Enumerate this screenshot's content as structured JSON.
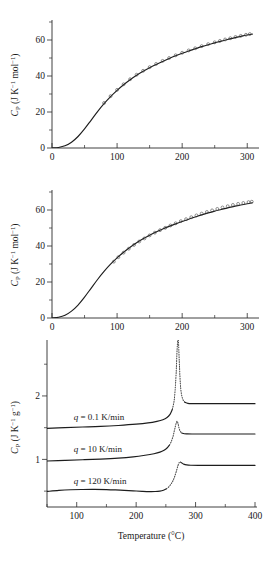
{
  "figure": {
    "background": "#ffffff",
    "curve_color": "#1d1d1d",
    "marker_color": "#3a3a3a",
    "axis_color": "#2b2b2b"
  },
  "panels": [
    {
      "id": "panel-top",
      "ylabel_parts": {
        "sym": "C",
        "sub": "P",
        "unit_open": " (J K",
        "unit_sup1": "−1",
        "unit_mid": " mol",
        "unit_sup2": "−1",
        "unit_close": ")"
      },
      "xlabel": "",
      "xticks": [
        0,
        100,
        200,
        300
      ],
      "xtick_labels": [
        "0",
        "100",
        "200",
        "300"
      ],
      "xminor": [
        50,
        150,
        250
      ],
      "yticks": [
        0,
        20,
        40,
        60
      ],
      "ytick_labels": [
        "0",
        "20",
        "40",
        "60"
      ],
      "yminor": [
        10,
        30,
        50,
        70
      ],
      "xlim": [
        0,
        315
      ],
      "ylim": [
        0,
        70
      ],
      "has_markers": true
    },
    {
      "id": "panel-mid",
      "ylabel_parts": {
        "sym": "C",
        "sub": "P",
        "unit_open": " (J K",
        "unit_sup1": "−1",
        "unit_mid": " mol",
        "unit_sup2": "−1",
        "unit_close": ")"
      },
      "xlabel": "",
      "xticks": [
        0,
        100,
        200,
        300
      ],
      "xtick_labels": [
        "0",
        "100",
        "200",
        "300"
      ],
      "xminor": [
        50,
        150,
        250
      ],
      "yticks": [
        0,
        20,
        40,
        60
      ],
      "ytick_labels": [
        "0",
        "20",
        "40",
        "60"
      ],
      "yminor": [
        10,
        30,
        50,
        70
      ],
      "xlim": [
        0,
        315
      ],
      "ylim": [
        0,
        70
      ],
      "has_markers": true
    },
    {
      "id": "panel-bot",
      "ylabel_parts": {
        "sym": "C",
        "sub": "P",
        "unit_open": " (J K",
        "unit_sup1": "−1",
        "unit_mid": " g",
        "unit_sup2": "−1",
        "unit_close": ")"
      },
      "xlabel": "Temperature (°C)",
      "xticks": [
        100,
        200,
        300,
        400
      ],
      "xtick_labels": [
        "100",
        "200",
        "300",
        "400"
      ],
      "xminor": [
        50,
        150,
        250,
        350
      ],
      "yticks": [
        1,
        2
      ],
      "ytick_labels": [
        "1",
        "2"
      ],
      "yminor": [
        0.5,
        1.5,
        2.5
      ],
      "xlim": [
        50,
        400
      ],
      "ylim": [
        0.25,
        2.85
      ],
      "has_markers": false
    }
  ],
  "chart_data": [
    {
      "type": "line",
      "panel": "panel-top",
      "title": "",
      "xlabel": "Temperature (K)",
      "ylabel": "C_P (J K^-1 mol^-1)",
      "xlim": [
        0,
        315
      ],
      "ylim": [
        0,
        70
      ],
      "grid": false,
      "legend": "none",
      "series": [
        {
          "name": "fitted heat capacity curve",
          "style": "solid-line",
          "x": [
            0,
            10,
            20,
            30,
            40,
            50,
            60,
            70,
            80,
            90,
            100,
            110,
            120,
            130,
            140,
            150,
            160,
            170,
            180,
            190,
            200,
            210,
            220,
            230,
            240,
            250,
            260,
            270,
            280,
            290,
            300,
            308
          ],
          "y": [
            0,
            0.3,
            1.2,
            3.2,
            6.4,
            10.6,
            15.4,
            20.2,
            24.6,
            28.5,
            32.0,
            35.1,
            37.9,
            40.4,
            42.6,
            44.6,
            46.4,
            48.1,
            49.7,
            51.2,
            52.6,
            53.9,
            55.1,
            56.3,
            57.4,
            58.4,
            59.4,
            60.3,
            61.2,
            62.0,
            62.8,
            63.3
          ]
        },
        {
          "name": "experimental data points",
          "style": "open-circles",
          "x": [
            80,
            90,
            100,
            110,
            120,
            130,
            140,
            150,
            160,
            170,
            180,
            190,
            200,
            210,
            220,
            230,
            240,
            250,
            258,
            266,
            274,
            282,
            290,
            298,
            304
          ],
          "y": [
            25.0,
            28.8,
            32.3,
            35.4,
            38.2,
            40.7,
            42.9,
            44.9,
            46.7,
            48.4,
            50.0,
            51.5,
            52.9,
            54.2,
            55.4,
            56.6,
            57.7,
            58.7,
            59.5,
            60.3,
            61.0,
            61.7,
            62.3,
            62.9,
            63.3
          ]
        }
      ]
    },
    {
      "type": "line",
      "panel": "panel-mid",
      "title": "",
      "xlabel": "Temperature (K)",
      "ylabel": "C_P (J K^-1 mol^-1)",
      "xlim": [
        0,
        315
      ],
      "ylim": [
        0,
        70
      ],
      "grid": false,
      "legend": "none",
      "series": [
        {
          "name": "fitted heat capacity curve",
          "style": "solid-line",
          "x": [
            0,
            10,
            20,
            30,
            40,
            50,
            60,
            70,
            80,
            90,
            100,
            110,
            120,
            130,
            140,
            150,
            160,
            170,
            180,
            190,
            200,
            210,
            220,
            230,
            240,
            250,
            260,
            270,
            280,
            290,
            300,
            308
          ],
          "y": [
            0,
            0.4,
            1.5,
            3.8,
            7.2,
            11.6,
            16.5,
            21.4,
            25.9,
            29.9,
            33.4,
            36.5,
            39.3,
            41.8,
            44.0,
            46.0,
            47.8,
            49.4,
            50.9,
            52.3,
            53.6,
            54.9,
            56.1,
            57.3,
            58.4,
            59.4,
            60.3,
            61.2,
            62.0,
            62.8,
            63.5,
            64.0
          ]
        },
        {
          "name": "experimental data points",
          "style": "open-circles",
          "x": [
            95,
            102,
            110,
            118,
            126,
            134,
            142,
            150,
            158,
            166,
            174,
            182,
            190,
            198,
            206,
            214,
            222,
            230,
            238,
            246,
            254,
            262,
            270,
            278,
            286,
            294,
            302,
            307
          ],
          "y": [
            31.3,
            33.8,
            36.3,
            38.5,
            40.6,
            42.5,
            44.2,
            45.9,
            47.4,
            48.8,
            50.1,
            51.4,
            52.6,
            53.8,
            54.9,
            56.0,
            57.0,
            58.0,
            58.9,
            59.8,
            60.6,
            61.4,
            62.1,
            62.8,
            63.4,
            63.9,
            64.4,
            64.6
          ]
        }
      ]
    },
    {
      "type": "line",
      "panel": "panel-bot",
      "title": "",
      "xlabel": "Temperature (°C)",
      "ylabel": "C_P (J K^-1 g^-1)",
      "xlim": [
        50,
        400
      ],
      "ylim": [
        0.25,
        2.85
      ],
      "grid": false,
      "legend": "inline-annotations",
      "annotations": [
        {
          "text_parts": {
            "q": "q",
            "rest": " = 0.1 K/min"
          },
          "text": "q = 0.1 K/min",
          "x": 95,
          "y": 1.62
        },
        {
          "text_parts": {
            "q": "q",
            "rest": " = 10 K/min"
          },
          "text": "q = 10 K/min",
          "x": 95,
          "y": 1.12
        },
        {
          "text_parts": {
            "q": "q",
            "rest": " = 120 K/min"
          },
          "text": "q = 120 K/min",
          "x": 95,
          "y": 0.62
        }
      ],
      "series": [
        {
          "name": "q = 0.1 K/min",
          "scan_rate": "0.1 K/min",
          "style": "solid-with-dotted-peak",
          "baseline_before": 1.49,
          "baseline_after": 1.88,
          "peak_temp": 270,
          "peak_height": 2.95,
          "x": [
            50,
            80,
            110,
            140,
            170,
            200,
            220,
            235,
            245,
            252,
            257,
            261,
            264,
            266,
            267.5,
            268.5,
            269.5,
            270.5,
            271.5,
            273,
            275,
            278,
            282,
            287,
            295,
            310,
            330,
            360,
            400
          ],
          "y": [
            1.49,
            1.5,
            1.51,
            1.52,
            1.535,
            1.555,
            1.575,
            1.6,
            1.625,
            1.66,
            1.71,
            1.79,
            1.93,
            2.15,
            2.4,
            2.65,
            2.82,
            2.92,
            2.8,
            2.45,
            2.12,
            1.96,
            1.9,
            1.883,
            1.879,
            1.878,
            1.878,
            1.878,
            1.878
          ],
          "dotted_from": 261,
          "dotted_to": 282
        },
        {
          "name": "q = 10 K/min",
          "scan_rate": "10 K/min",
          "style": "solid-with-dotted-peak",
          "baseline_before": 0.975,
          "baseline_after": 1.4,
          "peak_temp": 268,
          "peak_height": 1.6,
          "x": [
            50,
            80,
            110,
            140,
            170,
            195,
            215,
            230,
            240,
            247,
            252,
            256,
            259,
            262,
            264,
            266,
            267.5,
            269,
            270.5,
            272,
            274,
            277,
            281,
            286,
            294,
            310,
            330,
            360,
            400
          ],
          "y": [
            0.975,
            0.985,
            0.995,
            1.005,
            1.02,
            1.04,
            1.065,
            1.09,
            1.115,
            1.145,
            1.18,
            1.225,
            1.28,
            1.36,
            1.44,
            1.52,
            1.575,
            1.6,
            1.565,
            1.5,
            1.445,
            1.415,
            1.405,
            1.402,
            1.4,
            1.4,
            1.4,
            1.4,
            1.4
          ],
          "dotted_from": 256,
          "dotted_to": 277
        },
        {
          "name": "q = 120 K/min",
          "scan_rate": "120 K/min",
          "style": "solid-with-dotted-peak",
          "baseline_before": 0.5,
          "baseline_after": 0.905,
          "peak_temp": 272,
          "peak_height": 0.96,
          "x": [
            50,
            70,
            90,
            110,
            130,
            150,
            165,
            180,
            195,
            210,
            222,
            232,
            240,
            246,
            251,
            255,
            259,
            262,
            265,
            268,
            270.5,
            272.5,
            274.5,
            277,
            280,
            285,
            292,
            305,
            325,
            355,
            400
          ],
          "y": [
            0.495,
            0.512,
            0.522,
            0.526,
            0.527,
            0.524,
            0.519,
            0.512,
            0.504,
            0.497,
            0.493,
            0.494,
            0.501,
            0.515,
            0.538,
            0.568,
            0.615,
            0.665,
            0.735,
            0.825,
            0.905,
            0.952,
            0.958,
            0.942,
            0.925,
            0.913,
            0.908,
            0.906,
            0.905,
            0.905,
            0.905
          ],
          "dotted_from": 251,
          "dotted_to": 274
        }
      ]
    }
  ]
}
